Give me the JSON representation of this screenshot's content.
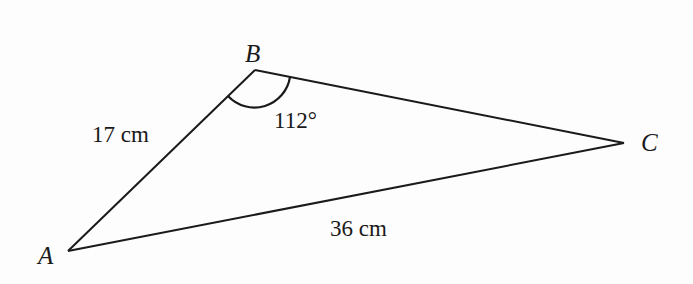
{
  "diagram": {
    "type": "triangle",
    "vertices": [
      {
        "name": "A"
      },
      {
        "name": "B"
      },
      {
        "name": "C"
      }
    ],
    "sides": [
      {
        "from": "A",
        "to": "B",
        "label": "17 cm"
      },
      {
        "from": "A",
        "to": "C",
        "label": "36 cm"
      },
      {
        "from": "B",
        "to": "C",
        "label": ""
      }
    ],
    "angles": [
      {
        "at": "B",
        "label": "112°"
      }
    ],
    "line_color": "#1a1a1a"
  }
}
